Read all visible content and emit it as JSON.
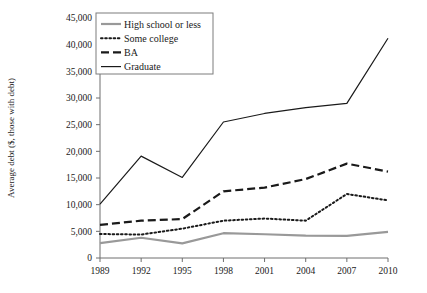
{
  "chart_data": {
    "type": "line",
    "title": "",
    "xlabel": "",
    "ylabel": "Average debt ($, those with debt)",
    "categories": [
      1989,
      1992,
      1995,
      1998,
      2001,
      2004,
      2007,
      2010
    ],
    "xtick_labels": [
      "1989",
      "1992",
      "1995",
      "1998",
      "2001",
      "2004",
      "2007",
      "2010"
    ],
    "ytick_labels": [
      "0",
      "5,000",
      "10,000",
      "15,000",
      "20,000",
      "25,000",
      "30,000",
      "35,000",
      "40,000",
      "45,000"
    ],
    "ytick_values": [
      0,
      5000,
      10000,
      15000,
      20000,
      25000,
      30000,
      35000,
      40000,
      45000
    ],
    "ylim": [
      0,
      45000
    ],
    "xlim": [
      1989,
      2010
    ],
    "grid": false,
    "legend_position": "top-left-inside",
    "series": [
      {
        "name": "High school or less",
        "style": "solid",
        "color": "#999999",
        "width": 2.2,
        "values": [
          2800,
          3800,
          2750,
          4650,
          4450,
          4200,
          4150,
          4900
        ]
      },
      {
        "name": "Some college",
        "style": "dotted",
        "color": "#1a1a1a",
        "width": 2.0,
        "values": [
          4500,
          4400,
          5500,
          7000,
          7400,
          7000,
          12000,
          10800
        ]
      },
      {
        "name": "BA",
        "style": "dashed",
        "color": "#1a1a1a",
        "width": 2.2,
        "values": [
          6200,
          7000,
          7300,
          12500,
          13200,
          14800,
          17700,
          16200
        ]
      },
      {
        "name": "Graduate",
        "style": "solid",
        "color": "#1a1a1a",
        "width": 1.2,
        "values": [
          10100,
          19100,
          15100,
          25500,
          27100,
          28200,
          29000,
          41200
        ]
      }
    ]
  }
}
